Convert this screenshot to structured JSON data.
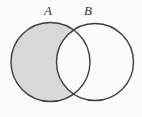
{
  "diagram": {
    "type": "venn",
    "sets": [
      {
        "label": "A"
      },
      {
        "label": "B"
      }
    ],
    "shaded_region": "A only (A excluding intersection with B)",
    "colors": {
      "background": "#fbfbfb",
      "shaded_fill": "#d8d8d8",
      "unshaded_fill": "#fbfbfb",
      "circle_stroke": "#3d3d3d",
      "label_text": "#333333"
    }
  }
}
